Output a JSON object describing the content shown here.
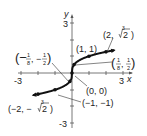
{
  "chart_data": {
    "type": "line",
    "title": "",
    "function": "y = cube root of x",
    "xlabel": "x",
    "ylabel": "y",
    "xlim": [
      -3,
      3
    ],
    "ylim": [
      -3,
      3
    ],
    "x_tick_labels": [
      "-3",
      "3"
    ],
    "y_tick_labels": [
      "3",
      "-3"
    ],
    "grid": false,
    "series": [
      {
        "name": "y = ∛x",
        "points": [
          {
            "x": -2,
            "y": -1.26,
            "label": "(-2, -∛2)"
          },
          {
            "x": -1,
            "y": -1,
            "label": "(-1, -1)"
          },
          {
            "x": -0.125,
            "y": -0.5,
            "label": "(-1/8, -1/2)"
          },
          {
            "x": 0,
            "y": 0,
            "label": "(0, 0)"
          },
          {
            "x": 0.125,
            "y": 0.5,
            "label": "(1/8, 1/2)"
          },
          {
            "x": 1,
            "y": 1,
            "label": "(1, 1)"
          },
          {
            "x": 2,
            "y": 1.26,
            "label": "(2, ∛2)"
          }
        ]
      }
    ],
    "annotations": {
      "p_neg2": {
        "pre": "(−2, −",
        "root_index": "3",
        "radicand": "2",
        "post": ")"
      },
      "p_neg1": "(−1, −1)",
      "p_neg_eighth": {
        "open": "(−",
        "n1": "1",
        "d1": "8",
        "mid": ", −",
        "n2": "1",
        "d2": "2",
        "close": ")"
      },
      "p_zero": "(0, 0)",
      "p_eighth": {
        "open": "(",
        "n1": "1",
        "d1": "8",
        "mid": ", ",
        "n2": "1",
        "d2": "2",
        "close": ")"
      },
      "p_one": "(1, 1)",
      "p_two": {
        "pre": "(2, ",
        "root_index": "3",
        "radicand": "2",
        "post": ")"
      }
    }
  }
}
